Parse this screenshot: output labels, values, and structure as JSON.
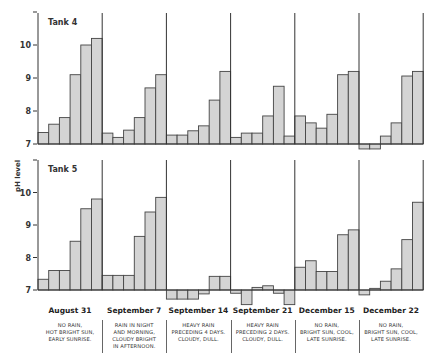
{
  "y_axis_label": "pH level",
  "chart_data": {
    "type": "bar",
    "title": "",
    "xlabel": "",
    "ylabel": "pH level",
    "ylim": [
      6.5,
      11
    ],
    "y_ticks": [
      7,
      8,
      9,
      10
    ],
    "baseline": 7,
    "grid": false,
    "categories": [
      "August 31",
      "September 7",
      "September 14",
      "September 21",
      "December 15",
      "December 22"
    ],
    "notes": [
      [
        "NO RAIN,",
        "HOT BRIGHT SUN,",
        "EARLY SUNRISE."
      ],
      [
        "RAIN IN NIGHT",
        "AND MORNING,",
        "CLOUDY BRIGHT",
        "IN AFTERNOON."
      ],
      [
        "HEAVY RAIN",
        "PRECEDING 4 DAYS.",
        "CLOUDY, DULL."
      ],
      [
        "HEAVY RAIN",
        "PRECEDING 2 DAYS.",
        "CLOUDY, DULL."
      ],
      [
        "NO RAIN,",
        "BRIGHT SUN, COOL,",
        "LATE SUNRISE."
      ],
      [
        "NO RAIN,",
        "BRIGHT SUN, COOL,",
        "LATE SUNRISE."
      ]
    ],
    "series": [
      {
        "name": "Tank 4",
        "values": [
          [
            7.35,
            7.6,
            7.8,
            9.1,
            10.0,
            10.2
          ],
          [
            7.33,
            7.2,
            7.42,
            7.8,
            8.7,
            9.1
          ],
          [
            7.27,
            7.27,
            7.4,
            7.55,
            8.33,
            9.2
          ],
          [
            7.2,
            7.33,
            7.33,
            7.85,
            8.75,
            7.24
          ],
          [
            7.85,
            7.64,
            7.48,
            7.9,
            9.1,
            9.2
          ],
          [
            6.85,
            6.85,
            7.24,
            7.64,
            9.06,
            9.2
          ]
        ]
      },
      {
        "name": "Tank 5",
        "values": [
          [
            7.33,
            7.6,
            7.6,
            8.5,
            9.5,
            9.8
          ],
          [
            7.45,
            7.45,
            7.45,
            8.65,
            9.4,
            9.85
          ],
          [
            6.72,
            6.72,
            6.72,
            6.88,
            7.42,
            7.42
          ],
          [
            6.9,
            6.55,
            7.08,
            7.13,
            6.9,
            6.55
          ],
          [
            7.7,
            7.9,
            7.57,
            7.57,
            8.7,
            8.85
          ],
          [
            6.85,
            7.05,
            7.27,
            7.65,
            8.55,
            9.7
          ]
        ]
      }
    ]
  },
  "colors": {
    "bar_fill": "#d4d4d4",
    "bar_stroke": "#444444",
    "axis": "#333333"
  }
}
